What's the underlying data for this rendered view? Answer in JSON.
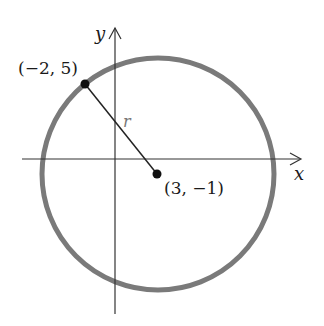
{
  "diagram": {
    "type": "circle-on-coordinate-plane",
    "axes": {
      "x_label": "x",
      "y_label": "y"
    },
    "circle": {
      "center": {
        "label": "(3, −1)",
        "x": 3,
        "y": -1
      },
      "point_on_circle": {
        "label": "(−2, 5)",
        "x": -2,
        "y": 5
      },
      "radius_label": "r",
      "stroke_color": "#7a7a7a"
    },
    "colors": {
      "axes": "#333333",
      "points": "#111111",
      "radius_line": "#222222"
    }
  }
}
